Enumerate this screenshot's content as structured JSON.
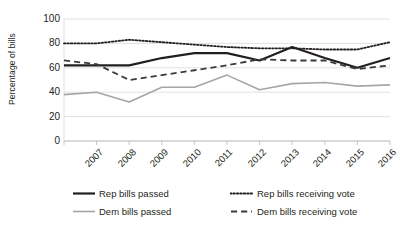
{
  "chart_data": {
    "type": "line",
    "title": "",
    "xlabel": "",
    "ylabel": "Percentage of bills",
    "categories": [
      "2007",
      "2008",
      "2009",
      "2010",
      "2011",
      "2012",
      "2013",
      "2014",
      "2015",
      "2016",
      "2017"
    ],
    "ylim": [
      0,
      100
    ],
    "ytick_values": [
      0,
      20,
      40,
      60,
      80,
      100
    ],
    "ytick_labels": [
      "0",
      "20",
      "40",
      "60",
      "80",
      "100"
    ],
    "grid": "horizontal",
    "legend_position": "bottom",
    "series": [
      {
        "name": "Rep bills passed",
        "style": "solid",
        "color": "#231f20",
        "width": 2.2,
        "values": [
          62,
          62,
          62,
          68,
          72,
          72,
          66,
          77,
          68,
          60,
          68
        ]
      },
      {
        "name": "Dem bills passed",
        "style": "solid",
        "color": "#a6a6a6",
        "width": 1.6,
        "values": [
          38,
          40,
          32,
          44,
          44,
          54,
          42,
          47,
          48,
          45,
          46
        ]
      },
      {
        "name": "Rep bills receiving vote",
        "style": "dotted",
        "color": "#231f20",
        "width": 1.8,
        "values": [
          80,
          80,
          83,
          81,
          79,
          77,
          76,
          76,
          75,
          75,
          81
        ]
      },
      {
        "name": "Dem bills receiving vote",
        "style": "dashed",
        "color": "#3b3b3b",
        "width": 1.8,
        "values": [
          66,
          63,
          50,
          54,
          58,
          62,
          67,
          66,
          66,
          59,
          62
        ]
      }
    ]
  },
  "axis": {
    "y_title": "Percentage of bills",
    "y_tick_0": "0",
    "y_tick_1": "20",
    "y_tick_2": "40",
    "y_tick_3": "60",
    "y_tick_4": "80",
    "y_tick_5": "100"
  },
  "legend": {
    "items": [
      {
        "label": "Rep bills passed"
      },
      {
        "label": "Dem bills passed"
      },
      {
        "label": "Rep bills receiving vote"
      },
      {
        "label": "Dem bills receiving vote"
      }
    ]
  }
}
